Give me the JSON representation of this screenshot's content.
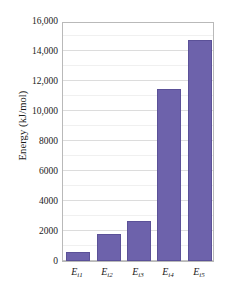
{
  "chart_data": {
    "type": "bar",
    "title": "",
    "xlabel": "",
    "ylabel": "Energy (kJ/mol)",
    "categories": [
      "Ei1",
      "Ei2",
      "Ei3",
      "Ei4",
      "Ei5"
    ],
    "category_labels": [
      {
        "base": "E",
        "sub": "i1"
      },
      {
        "base": "E",
        "sub": "i2"
      },
      {
        "base": "E",
        "sub": "i3"
      },
      {
        "base": "E",
        "sub": "i4"
      },
      {
        "base": "E",
        "sub": "i5"
      }
    ],
    "values": [
      600,
      1800,
      2700,
      11500,
      14750
    ],
    "ylim": [
      0,
      16000
    ],
    "ytick_values": [
      0,
      2000,
      4000,
      6000,
      8000,
      10000,
      12000,
      14000,
      16000
    ],
    "ytick_labels": [
      "0",
      "2000",
      "4000",
      "6000",
      "8000",
      "10,000",
      "12,000",
      "14,000",
      "16,000"
    ],
    "minor_ytick_values": [
      1000,
      3000,
      5000,
      7000,
      9000,
      11000,
      13000,
      15000
    ],
    "grid": true,
    "legend": false,
    "legend_position": "none",
    "bar_color": "#6d62ab",
    "bar_border_color": "#5b5198",
    "plot_border_color": "#b9b9b9",
    "gridline_color": "#e8e8e8",
    "background_color": "#ffffff"
  }
}
